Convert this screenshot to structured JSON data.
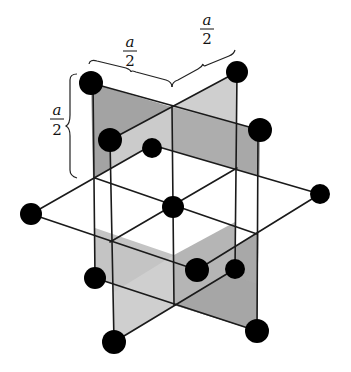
{
  "labels": {
    "top_left": {
      "numerator": "a",
      "denominator": "2"
    },
    "top_right": {
      "numerator": "a",
      "denominator": "2"
    },
    "left": {
      "numerator": "a",
      "denominator": "2"
    }
  },
  "colors": {
    "plane_dark": "#9a9a9a",
    "plane_light": "#c9c9c9",
    "plane_horizontal": "#ffffff",
    "atom": "#000000",
    "edge": "#1a1a1a"
  },
  "atoms": [
    {
      "id": "top-left",
      "x": 91,
      "y": 83,
      "r": 12
    },
    {
      "id": "top-right",
      "x": 237,
      "y": 72,
      "r": 11
    },
    {
      "id": "right-upper",
      "x": 260,
      "y": 130,
      "r": 12
    },
    {
      "id": "left-inner",
      "x": 110,
      "y": 140,
      "r": 12
    },
    {
      "id": "back-inner",
      "x": 152,
      "y": 148,
      "r": 10
    },
    {
      "id": "center",
      "x": 173,
      "y": 207,
      "r": 11
    },
    {
      "id": "left-horizontal",
      "x": 31,
      "y": 214,
      "r": 11
    },
    {
      "id": "right-horizontal",
      "x": 320,
      "y": 194,
      "r": 10
    },
    {
      "id": "left-lower",
      "x": 95,
      "y": 278,
      "r": 11
    },
    {
      "id": "front-lower",
      "x": 197,
      "y": 270,
      "r": 12
    },
    {
      "id": "right-lower-inner",
      "x": 235,
      "y": 269,
      "r": 10
    },
    {
      "id": "bottom-left",
      "x": 114,
      "y": 342,
      "r": 12
    },
    {
      "id": "bottom-right",
      "x": 257,
      "y": 331,
      "r": 12
    }
  ]
}
